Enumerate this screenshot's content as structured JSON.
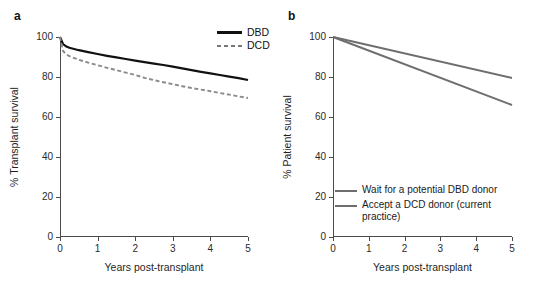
{
  "figure": {
    "panel_a_letter": "a",
    "panel_b_letter": "b"
  },
  "chart_data": [
    {
      "id": "panel-a",
      "type": "line",
      "title": "",
      "panel_label": "a",
      "xlabel": "Years post-transplant",
      "ylabel": "% Transplant survival",
      "xlim": [
        0,
        5
      ],
      "ylim": [
        0,
        100
      ],
      "xticks": [
        0,
        1,
        2,
        3,
        4,
        5
      ],
      "xtick_labels": [
        "0",
        "1",
        "2",
        "3",
        "4",
        "5"
      ],
      "yticks": [
        0,
        20,
        40,
        60,
        80,
        100
      ],
      "ytick_labels": [
        "0",
        "20",
        "40",
        "60",
        "80",
        "100"
      ],
      "grid": false,
      "legend_position": "top-right",
      "series": [
        {
          "name": "DBD",
          "style": "solid",
          "color": "#111111",
          "x": [
            0,
            0.08,
            0.17,
            0.25,
            0.5,
            0.75,
            1,
            1.25,
            1.5,
            1.75,
            2,
            2.25,
            2.5,
            2.75,
            3,
            3.25,
            3.5,
            3.75,
            4,
            4.25,
            4.5,
            4.75,
            5
          ],
          "values": [
            100,
            96.5,
            95.2,
            94.6,
            93.4,
            92.4,
            91.5,
            90.6,
            89.8,
            89.0,
            88.2,
            87.4,
            86.7,
            86.0,
            85.2,
            84.3,
            83.4,
            82.6,
            81.8,
            81.0,
            80.2,
            79.4,
            78.5
          ]
        },
        {
          "name": "DCD",
          "style": "dashed",
          "color": "#8a8a8a",
          "x": [
            0,
            0.08,
            0.17,
            0.25,
            0.5,
            0.75,
            1,
            1.25,
            1.5,
            1.75,
            2,
            2.25,
            2.5,
            2.75,
            3,
            3.25,
            3.5,
            3.75,
            4,
            4.25,
            4.5,
            4.75,
            5
          ],
          "values": [
            100,
            93.0,
            91.3,
            90.4,
            88.6,
            87.2,
            85.9,
            84.6,
            83.4,
            82.2,
            81.0,
            79.6,
            78.4,
            77.4,
            76.4,
            75.4,
            74.5,
            73.7,
            72.9,
            72.0,
            71.2,
            70.3,
            69.5
          ]
        }
      ],
      "legend": [
        {
          "label": "DBD",
          "style": "solid",
          "color": "#111111"
        },
        {
          "label": "DCD",
          "style": "dashed",
          "color": "#8a8a8a"
        }
      ]
    },
    {
      "id": "panel-b",
      "type": "line",
      "title": "",
      "panel_label": "b",
      "xlabel": "Years post-transplant",
      "ylabel": "% Patient survival",
      "xlim": [
        0,
        5
      ],
      "ylim": [
        0,
        100
      ],
      "xticks": [
        0,
        1,
        2,
        3,
        4,
        5
      ],
      "xtick_labels": [
        "0",
        "1",
        "2",
        "3",
        "4",
        "5"
      ],
      "yticks": [
        0,
        20,
        40,
        60,
        80,
        100
      ],
      "ytick_labels": [
        "0",
        "20",
        "40",
        "60",
        "80",
        "100"
      ],
      "grid": false,
      "legend_position": "inside-lower-left",
      "series": [
        {
          "name": "Wait for a potential DBD donor",
          "style": "solid",
          "color": "#6e6e6e",
          "x": [
            0,
            5
          ],
          "values": [
            100,
            79.5
          ]
        },
        {
          "name": "Accept a DCD donor (current practice)",
          "style": "solid",
          "color": "#6e6e6e",
          "x": [
            0,
            5
          ],
          "values": [
            100,
            66.0
          ]
        }
      ],
      "legend": [
        {
          "label": "Wait for a potential DBD donor",
          "style": "solid",
          "color": "#6e6e6e"
        },
        {
          "label": "Accept a DCD donor (current",
          "label_line2": "practice)",
          "style": "solid",
          "color": "#6e6e6e"
        }
      ]
    }
  ]
}
